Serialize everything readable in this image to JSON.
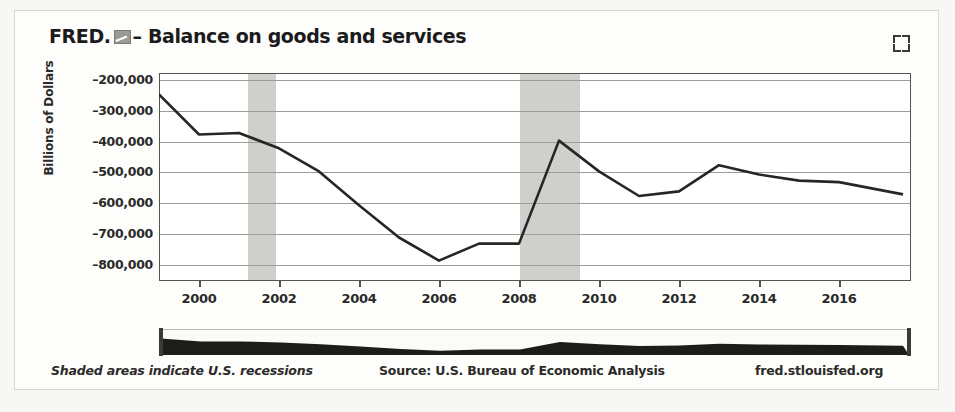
{
  "header": {
    "brand": "FRED.",
    "dash": "–",
    "title": "Balance on goods and services",
    "logo_icon": "fred-chart-icon",
    "fullscreen_icon": "fullscreen-expand-icon"
  },
  "footer": {
    "note": "Shaded areas indicate U.S. recessions",
    "source": "Source: U.S. Bureau of Economic Analysis",
    "site": "fred.stlouisfed.org"
  },
  "chart_data": {
    "type": "line",
    "title": "Balance on goods and services",
    "xlabel": "",
    "ylabel": "Billions of Dollars",
    "xlim": [
      1999,
      2017.75
    ],
    "ylim": [
      -850000,
      -180000
    ],
    "ytick_values": [
      -200000,
      -300000,
      -400000,
      -500000,
      -600000,
      -700000,
      -800000
    ],
    "ytick_labels": [
      "–200,000",
      "–300,000",
      "–400,000",
      "–500,000",
      "–600,000",
      "–700,000",
      "–800,000"
    ],
    "xtick_values": [
      2000,
      2002,
      2004,
      2006,
      2008,
      2010,
      2012,
      2014,
      2016
    ],
    "xtick_labels": [
      "2000",
      "2002",
      "2004",
      "2006",
      "2008",
      "2010",
      "2012",
      "2014",
      "2016"
    ],
    "grid": true,
    "legend": false,
    "line_color": "#262624",
    "band_color": "#cfcfcb",
    "series": [
      {
        "name": "Balance on goods and services",
        "x": [
          1999,
          2000,
          2001,
          2002,
          2003,
          2004,
          2005,
          2006,
          2007,
          2008,
          2009,
          2010,
          2011,
          2012,
          2013,
          2014,
          2015,
          2016,
          2017.6
        ],
        "values": [
          -250000,
          -380000,
          -375000,
          -425000,
          -500000,
          -610000,
          -715000,
          -790000,
          -735000,
          -735000,
          -400000,
          -500000,
          -580000,
          -565000,
          -480000,
          -510000,
          -530000,
          -535000,
          -575000
        ]
      }
    ],
    "recession_bands": [
      {
        "start": 2001.2,
        "end": 2001.9
      },
      {
        "start": 2008.0,
        "end": 2009.5
      }
    ],
    "annotations": [
      "Shaded areas indicate U.S. recessions"
    ]
  },
  "navigator": {
    "name": "range-selector",
    "left_handle": "left-range-handle",
    "right_handle": "right-range-handle"
  }
}
